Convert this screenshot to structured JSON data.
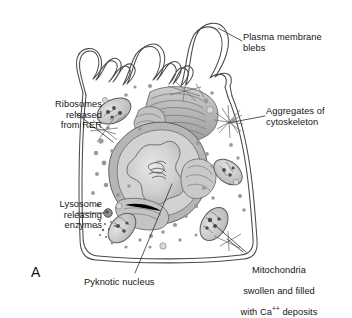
{
  "figure": {
    "panel_letter": "A",
    "background_color": "#ffffff",
    "line_color": "#4a4a4a",
    "text_color": "#151515"
  },
  "labels": {
    "plasma_membrane_blebs": "Plasma membrane\nblebs",
    "ribosomes_released_from_rer": "Ribosomes\nreleased\nfrom RER",
    "lysosome_releasing_enzymes": "Lysosome\nreleasing\nenzymes",
    "aggregates_of_cytoskeleton": "Aggregates of\ncytoskeleton",
    "pyknotic_nucleus": "Pyknotic nucleus",
    "mitochondria_line1": "Mitochondria",
    "mitochondria_line2": "swollen and filled",
    "mitochondria_line3_pre": "with Ca",
    "mitochondria_line3_sup": "++",
    "mitochondria_line3_post": " deposits"
  }
}
